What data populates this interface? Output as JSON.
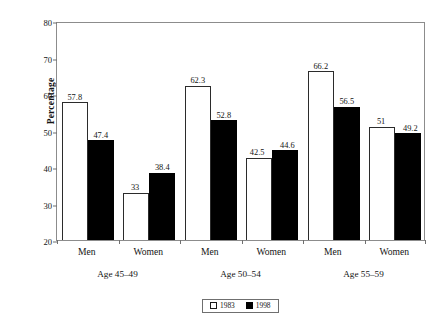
{
  "chart_data": {
    "type": "bar",
    "title": "",
    "subtitle": "",
    "xlabel": "",
    "ylabel": "Percentage",
    "ylim": [
      20,
      80
    ],
    "yticks": [
      20,
      30,
      40,
      50,
      60,
      70,
      80
    ],
    "grid": false,
    "legend_position": "bottom-center",
    "categories": [
      "Men",
      "Women",
      "Men",
      "Women",
      "Men",
      "Women"
    ],
    "groups": [
      {
        "label": "Age 45–49",
        "categories": [
          "Men",
          "Women"
        ]
      },
      {
        "label": "Age 50–54",
        "categories": [
          "Men",
          "Women"
        ]
      },
      {
        "label": "Age 55–59",
        "categories": [
          "Men",
          "Women"
        ]
      }
    ],
    "series": [
      {
        "name": "1983",
        "color": "#ffffff",
        "edge_color": "#2b2b2b",
        "values": [
          57.8,
          33,
          62.3,
          42.5,
          66.2,
          51
        ],
        "labels": [
          "57.8",
          "33",
          "62.3",
          "42.5",
          "66.2",
          "51"
        ]
      },
      {
        "name": "1998",
        "color": "#000000",
        "edge_color": "#000000",
        "values": [
          47.4,
          38.4,
          52.8,
          44.6,
          56.5,
          49.2
        ],
        "labels": [
          "47.4",
          "38.4",
          "52.8",
          "44.6",
          "56.5",
          "49.2"
        ]
      }
    ]
  },
  "axis": {
    "y_title": "Percentage",
    "y_tick_labels": [
      "20",
      "30",
      "40",
      "50",
      "60",
      "70",
      "80"
    ]
  },
  "category_labels": [
    "Men",
    "Women",
    "Men",
    "Women",
    "Men",
    "Women"
  ],
  "group_labels": [
    "Age 45–49",
    "Age 50–54",
    "Age 55–59"
  ],
  "legend": {
    "items": [
      {
        "label": "1983",
        "swatch": "open-square-swatch"
      },
      {
        "label": "1998",
        "swatch": "filled-square-swatch"
      }
    ]
  },
  "bar_labels": {
    "g0_1983": "57.8",
    "g0_1998": "47.4",
    "g1_1983": "33",
    "g1_1998": "38.4",
    "g2_1983": "62.3",
    "g2_1998": "52.8",
    "g3_1983": "42.5",
    "g3_1998": "44.6",
    "g4_1983": "66.2",
    "g4_1998": "56.5",
    "g5_1983": "51",
    "g5_1998": "49.2"
  }
}
